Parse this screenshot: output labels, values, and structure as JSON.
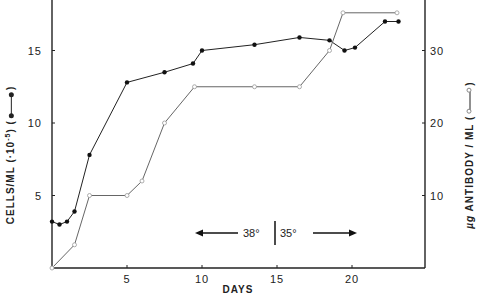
{
  "chart_data": {
    "type": "line",
    "title": "",
    "xlabel": "DAYS",
    "ylabel_left": "CELLS/ML (·10^-5)",
    "ylabel_right": "µg ANTIBODY / ML",
    "xlim": [
      0,
      25
    ],
    "ylim_left": [
      0,
      18.5
    ],
    "ylim_right": [
      0,
      37
    ],
    "x_ticks": [
      5,
      10,
      15,
      20
    ],
    "y_ticks_left": [
      5,
      10,
      15
    ],
    "y_ticks_right": [
      10,
      20,
      30
    ],
    "grid": false,
    "legend_position": "inline in axis labels",
    "series": [
      {
        "name": "Cells/ml (·10^-5)",
        "axis": "left",
        "marker": "filled circle",
        "color": "#222222",
        "x": [
          0,
          0.5,
          1,
          1.5,
          2.5,
          5,
          7.5,
          9.4,
          10,
          13.5,
          16.5,
          18.5,
          19.5,
          20.2,
          22.2,
          23.1
        ],
        "y": [
          3.2,
          3.0,
          3.2,
          3.9,
          7.8,
          12.8,
          13.5,
          14.1,
          15.0,
          15.4,
          15.9,
          15.7,
          15.0,
          15.2,
          17.0,
          17.0
        ]
      },
      {
        "name": "µg Antibody/ml",
        "axis": "right",
        "marker": "open circle",
        "color": "#555555",
        "x": [
          0,
          1.5,
          2.5,
          5,
          6,
          7.5,
          9.5,
          13.5,
          16.5,
          18.5,
          19.4,
          23
        ],
        "y": [
          0,
          3.2,
          10,
          10,
          12,
          20,
          25,
          25,
          25,
          30,
          35.2,
          35.2
        ]
      }
    ],
    "annotations": [
      {
        "text": "38°",
        "arrow": "left",
        "x_day": 12
      },
      {
        "text": "35°",
        "arrow": "right",
        "x_day": 17
      },
      {
        "text": "|",
        "divider_at_day": 14.2
      }
    ]
  },
  "labels": {
    "x_axis_title": "DAYS",
    "y_left_title": "CELLS/ML",
    "y_left_scale_prefix": "(·10",
    "y_left_scale_exp": "-5",
    "y_left_scale_suffix": ")",
    "y_right_prefix": "µg",
    "y_right_title": "ANTIBODY / ML",
    "temp_left": "38°",
    "temp_right": "35°"
  }
}
